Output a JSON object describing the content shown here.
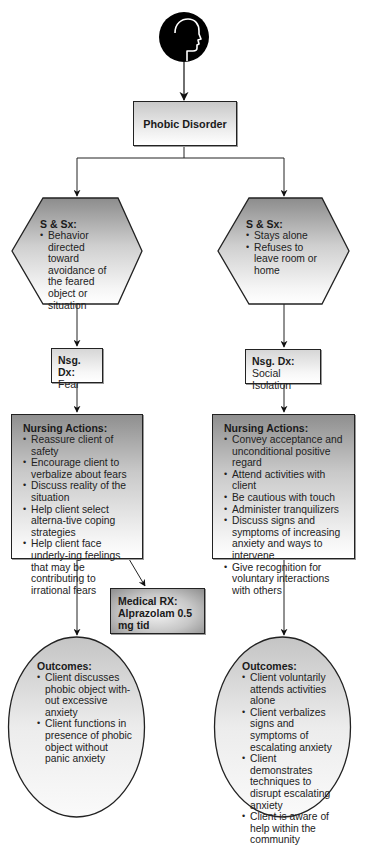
{
  "diagram": {
    "root": {
      "icon": "human-head-profile-icon",
      "label": "Phobic Disorder"
    },
    "left_branch": {
      "signs_symptoms": {
        "title": "S & Sx:",
        "items": [
          "Behavior directed toward avoidance of the feared object or situation"
        ]
      },
      "nursing_diagnosis": {
        "title": "Nsg. Dx:",
        "value": "Fear"
      },
      "nursing_actions": {
        "title": "Nursing Actions:",
        "items": [
          "Reassure client of safety",
          "Encourage client to verbalize about fears",
          "Discuss reality of the situation",
          "Help client select alterna-tive coping strategies",
          "Help client face underly-ing feelings that may be contributing to irrational fears"
        ]
      },
      "medical_rx": {
        "title": "Medical RX:",
        "value": "Alprazolam 0.5 mg tid"
      },
      "outcomes": {
        "title": "Outcomes:",
        "items": [
          "Client discusses phobic object with-out excessive anxiety",
          "Client functions in presence of phobic object without panic anxiety"
        ]
      }
    },
    "right_branch": {
      "signs_symptoms": {
        "title": "S & Sx:",
        "items": [
          "Stays alone",
          "Refuses to leave room or home"
        ]
      },
      "nursing_diagnosis": {
        "title": "Nsg. Dx:",
        "value": "Social Isolation"
      },
      "nursing_actions": {
        "title": "Nursing Actions:",
        "items": [
          "Convey acceptance and unconditional positive regard",
          "Attend activities with client",
          "Be cautious with touch",
          "Administer tranquilizers",
          "Discuss signs and symptoms of increasing anxiety and ways to intervene",
          "Give recognition for voluntary interactions with others"
        ]
      },
      "outcomes": {
        "title": "Outcomes:",
        "items": [
          "Client voluntarily attends activities alone",
          "Client verbalizes signs and symptoms of escalating anxiety",
          "Client demonstrates techniques to disrupt escalating anxiety",
          "Client is aware of help within the community"
        ]
      }
    },
    "colors": {
      "line": "#222222",
      "fill_dark": "#8f8f8f",
      "fill_light": "#ffffff"
    }
  }
}
